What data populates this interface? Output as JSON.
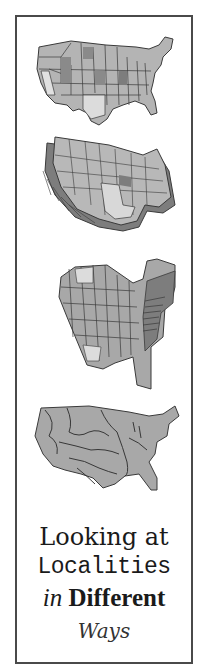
{
  "title": {
    "line1": "Looking at",
    "line2": "Localities",
    "line3_prefix": "in",
    "line3_main": "Different",
    "line4": "Ways"
  },
  "maps": [
    {
      "name": "us-map-states-flat",
      "description": "Flat choropleth of US states in gray shades"
    },
    {
      "name": "us-map-states-extruded",
      "description": "3D extruded prism map of US states"
    },
    {
      "name": "us-map-states-extruded-rotated",
      "description": "Rotated 3D prism map of US states with tall eastern states"
    },
    {
      "name": "us-map-river-basins",
      "description": "US map showing river basins / watersheds"
    }
  ],
  "colors": {
    "border": "#4a4a4a",
    "map_light": "#d4d4d4",
    "map_mid": "#a8a8a8",
    "map_dark": "#7d7d7d",
    "outline": "#3a3a3a"
  }
}
